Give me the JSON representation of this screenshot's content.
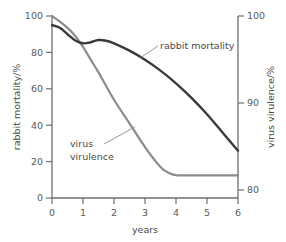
{
  "chart_data": {
    "type": "line",
    "title": "",
    "xlabel": "years",
    "ylabel": "rabbit mortality/%",
    "y2label": "virus virulence/%",
    "xlim": [
      0,
      6
    ],
    "ylim": [
      0,
      100
    ],
    "y2lim": [
      78.4,
      100
    ],
    "xticks": [
      "0",
      "1",
      "2",
      "3",
      "4",
      "5",
      "6"
    ],
    "xtick_values": [
      0,
      1,
      2,
      3,
      4,
      5,
      6
    ],
    "yticks": [
      "0",
      "20",
      "40",
      "60",
      "80",
      "100"
    ],
    "ytick_values": [
      0,
      20,
      40,
      60,
      80,
      100
    ],
    "y2ticks": [
      "80",
      "90",
      "100"
    ],
    "y2tick_values": [
      80,
      90,
      100
    ],
    "grid": false,
    "legend": "inline-annotations",
    "series": [
      {
        "name": "rabbit mortality",
        "axis": "left",
        "color": "#3a3a3a",
        "width": 2.4,
        "x": [
          0,
          0.25,
          0.5,
          0.75,
          1.0,
          1.25,
          1.5,
          1.75,
          2.0,
          2.5,
          3.0,
          3.5,
          4.0,
          4.5,
          5.0,
          5.5,
          6.0
        ],
        "values": [
          95,
          93.5,
          90,
          86.5,
          85,
          85.6,
          86.8,
          86.4,
          85,
          81,
          76,
          70,
          63,
          55,
          46,
          36,
          26
        ]
      },
      {
        "name": "virus virulence",
        "axis": "right",
        "color": "#8c8c8c",
        "width": 2.2,
        "x": [
          0,
          0.25,
          0.5,
          0.75,
          1.0,
          1.25,
          1.5,
          2.0,
          2.5,
          3.0,
          3.5,
          3.75,
          4.0,
          4.5,
          5.0,
          5.5,
          6.0
        ],
        "values_left_scale": [
          100,
          97,
          93.5,
          89,
          83,
          76,
          69,
          54,
          41,
          28,
          17,
          14,
          12.6,
          12.4,
          12.4,
          12.4,
          12.4
        ],
        "values": [
          100,
          99.35,
          98.6,
          97.6,
          96.3,
          94.8,
          93.3,
          90.1,
          87.3,
          84.5,
          82.1,
          81.5,
          81.2,
          81.1,
          81.1,
          81.1,
          81.1
        ]
      }
    ],
    "annotations": [
      {
        "name": "rabbit mortality",
        "text": "rabbit mortality",
        "leader": true
      },
      {
        "name": "virus virulence",
        "text_line1": "virus",
        "text_line2": "virulence",
        "leader": true
      }
    ],
    "colors": {
      "rabbit_mortality": "#3a3a3a",
      "virus_virulence": "#8c8c8c",
      "axis": "#6e6e6e",
      "text": "#4a4a4a",
      "background": "#ffffff"
    }
  },
  "axes": {
    "left": {
      "label": "rabbit mortality/%"
    },
    "right": {
      "label": "virus virulence/%"
    },
    "bottom": {
      "label": "years"
    }
  },
  "annotations": {
    "rabbit": {
      "label": "rabbit mortality"
    },
    "virus": {
      "line1": "virus",
      "line2": "virulence"
    }
  }
}
